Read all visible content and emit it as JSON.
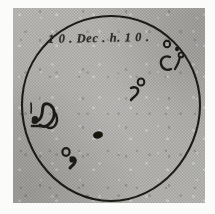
{
  "figure": {
    "kind": "historical-sunspot-drawing",
    "medium": "ink on aged gray paper",
    "inscription": "1 0 . Dec . h. 1 0 .",
    "inscription_reading": "10.Dec.h.10.",
    "disk": {
      "label": "solar-disk-outline",
      "center_x": 111,
      "center_y": 105,
      "radius": 89
    },
    "colors": {
      "paper": "#b3b2ae",
      "ink": "#1d1a17",
      "page_margin": "#fbfbfa",
      "inscription_ink": "#25211d"
    },
    "spot_groups": [
      {
        "name": "upper-right-limb-group",
        "description": "cluster of four small spots near the north-east limb",
        "count": 4
      },
      {
        "name": "upper-right-inner-pair",
        "description": "small open circle with comma-shaped penumbra below",
        "count": 2
      },
      {
        "name": "west-serpentine-group",
        "description": "large irregular serpentine spot chain on the left limb side",
        "count": 1
      },
      {
        "name": "central-spot",
        "description": "single solid dark elliptical spot near disk centre",
        "count": 1
      },
      {
        "name": "lower-left-pair",
        "description": "small ring spot with solid companion below-right",
        "count": 2
      }
    ]
  }
}
